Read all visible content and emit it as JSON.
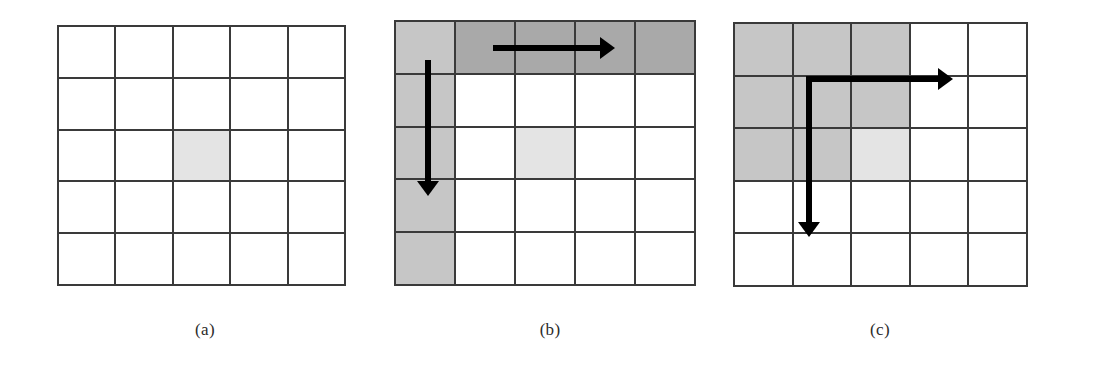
{
  "figure": {
    "background_color": "#ffffff",
    "grid_line_color": "#3a3a3a",
    "arrow_color": "#000000",
    "shade_colors": {
      "none": "#ffffff",
      "light": "#e4e4e4",
      "mid": "#c6c6c6",
      "dark": "#a9a9a9"
    },
    "rows": 5,
    "cols": 5
  },
  "panels": [
    {
      "id": "a",
      "label": "(a)",
      "x": 57,
      "y": 25,
      "width": 289,
      "height": 261,
      "label_x": 145,
      "label_y": 320,
      "cells": [
        [
          "none",
          "none",
          "none",
          "none",
          "none"
        ],
        [
          "none",
          "none",
          "none",
          "none",
          "none"
        ],
        [
          "none",
          "none",
          "light",
          "none",
          "none"
        ],
        [
          "none",
          "none",
          "none",
          "none",
          "none"
        ],
        [
          "none",
          "none",
          "none",
          "none",
          "none"
        ]
      ],
      "arrows": []
    },
    {
      "id": "b",
      "label": "(b)",
      "x": 394,
      "y": 20,
      "width": 302,
      "height": 266,
      "label_x": 490,
      "label_y": 320,
      "cells": [
        [
          "mid",
          "dark",
          "dark",
          "dark",
          "dark"
        ],
        [
          "mid",
          "none",
          "none",
          "none",
          "none"
        ],
        [
          "mid",
          "none",
          "light",
          "none",
          "none"
        ],
        [
          "mid",
          "none",
          "none",
          "none",
          "none"
        ],
        [
          "mid",
          "none",
          "none",
          "none",
          "none"
        ]
      ],
      "arrows": [
        {
          "name": "horizontal-arrow",
          "direction": "right",
          "x1": 99,
          "y1": 28,
          "x2": 221,
          "y2": 28
        },
        {
          "name": "vertical-arrow",
          "direction": "down",
          "x1": 34,
          "y1": 40,
          "x2": 34,
          "y2": 176
        }
      ]
    },
    {
      "id": "c",
      "label": "(c)",
      "x": 733,
      "y": 22,
      "width": 295,
      "height": 265,
      "label_x": 820,
      "label_y": 320,
      "cells": [
        [
          "mid",
          "mid",
          "mid",
          "none",
          "none"
        ],
        [
          "mid",
          "mid",
          "mid",
          "none",
          "none"
        ],
        [
          "mid",
          "mid",
          "light",
          "none",
          "none"
        ],
        [
          "none",
          "none",
          "none",
          "none",
          "none"
        ],
        [
          "none",
          "none",
          "none",
          "none",
          "none"
        ]
      ],
      "arrows": [
        {
          "name": "elbow-arrow",
          "direction": "right-and-down",
          "corner_x": 76,
          "corner_y": 57,
          "right_x": 220,
          "down_y": 215
        }
      ]
    }
  ]
}
